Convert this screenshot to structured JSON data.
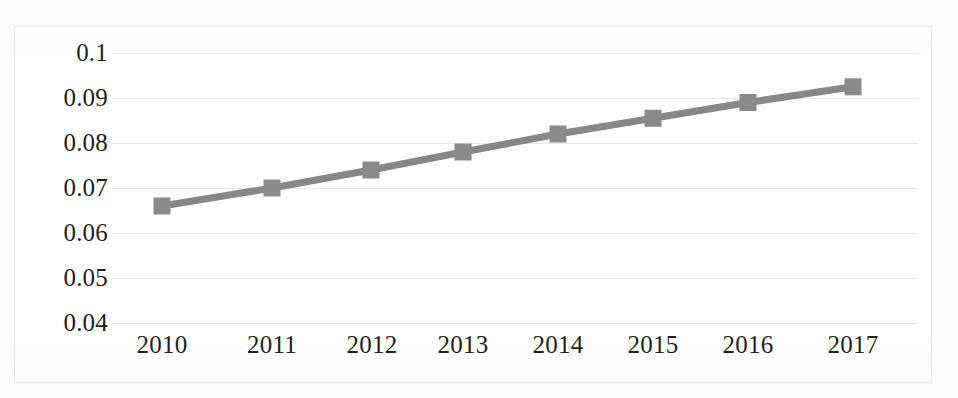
{
  "chart_data": {
    "type": "line",
    "title": "",
    "subtitle": "",
    "xlabel": "",
    "ylabel": "",
    "categories": [
      "2010",
      "2011",
      "2012",
      "2013",
      "2014",
      "2015",
      "2016",
      "2017"
    ],
    "values": [
      0.066,
      0.07,
      0.074,
      0.078,
      0.082,
      0.0855,
      0.089,
      0.0925
    ],
    "series": [
      {
        "name": "series-1",
        "values": [
          0.066,
          0.07,
          0.074,
          0.078,
          0.082,
          0.0855,
          0.089,
          0.0925
        ]
      }
    ],
    "y_ticks": [
      "0.1",
      "0.09",
      "0.08",
      "0.07",
      "0.06",
      "0.05",
      "0.04"
    ],
    "y_tick_values": [
      0.1,
      0.09,
      0.08,
      0.07,
      0.06,
      0.05,
      0.04
    ],
    "ylim": [
      0.04,
      0.1
    ],
    "grid": "horizontal",
    "legend": "none",
    "marker": "square",
    "line_color": "#878787",
    "marker_color": "#8a8a8a",
    "grid_color": "#e7e8ea",
    "text_color": "#231f20",
    "background_color": "#ffffff",
    "border_color": "#e9eaec"
  }
}
